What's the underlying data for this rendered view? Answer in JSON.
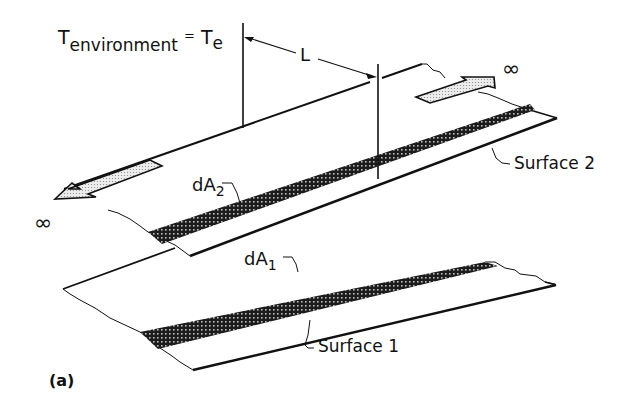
{
  "figure": {
    "panel_label": "(a)",
    "environment_label": {
      "symbol": "T",
      "subscript": "environment",
      "equals": "=",
      "rhs_symbol": "T",
      "rhs_subscript": "e"
    },
    "length_label": "L",
    "infinity_left": "∞",
    "infinity_right": "∞",
    "element_2": {
      "symbol": "dA",
      "subscript": "2"
    },
    "element_1": {
      "symbol": "dA",
      "subscript": "1"
    },
    "surface_2_label": "Surface 2",
    "surface_1_label": "Surface 1"
  },
  "colors": {
    "ink": "#111111",
    "background": "#ffffff",
    "strip_fill": "#2a2a2a",
    "arrow_fill": "#d8d8d8"
  }
}
